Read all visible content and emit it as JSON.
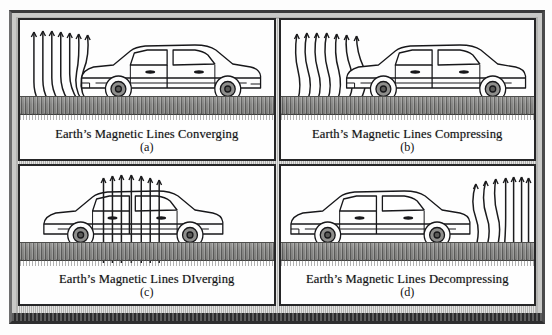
{
  "figure": {
    "panel_count": 4,
    "frame_color": "#c9c9c7",
    "ink_color": "#1b1b1d",
    "road_color": "#777775"
  },
  "panels": [
    {
      "id": "a",
      "caption": "Earth’s Magnetic Lines Converging",
      "sub_label": "(a)",
      "field_position": "front-left",
      "field_state": "converging",
      "car_facing": "left",
      "icon": "car-side-icon"
    },
    {
      "id": "b",
      "caption": "Earth’s Magnetic Lines Compressing",
      "sub_label": "(b)",
      "field_position": "front-left",
      "field_state": "compressing",
      "car_facing": "left",
      "icon": "car-side-icon"
    },
    {
      "id": "c",
      "caption": "Earth’s Magnetic Lines DIverging",
      "sub_label": "(c)",
      "field_position": "through-center",
      "field_state": "diverging",
      "car_facing": "left",
      "icon": "car-side-icon"
    },
    {
      "id": "d",
      "caption": "Earth’s Magnetic Lines Decompressing",
      "sub_label": "(d)",
      "field_position": "rear-right",
      "field_state": "decompressing",
      "car_facing": "left",
      "icon": "car-side-icon"
    }
  ]
}
